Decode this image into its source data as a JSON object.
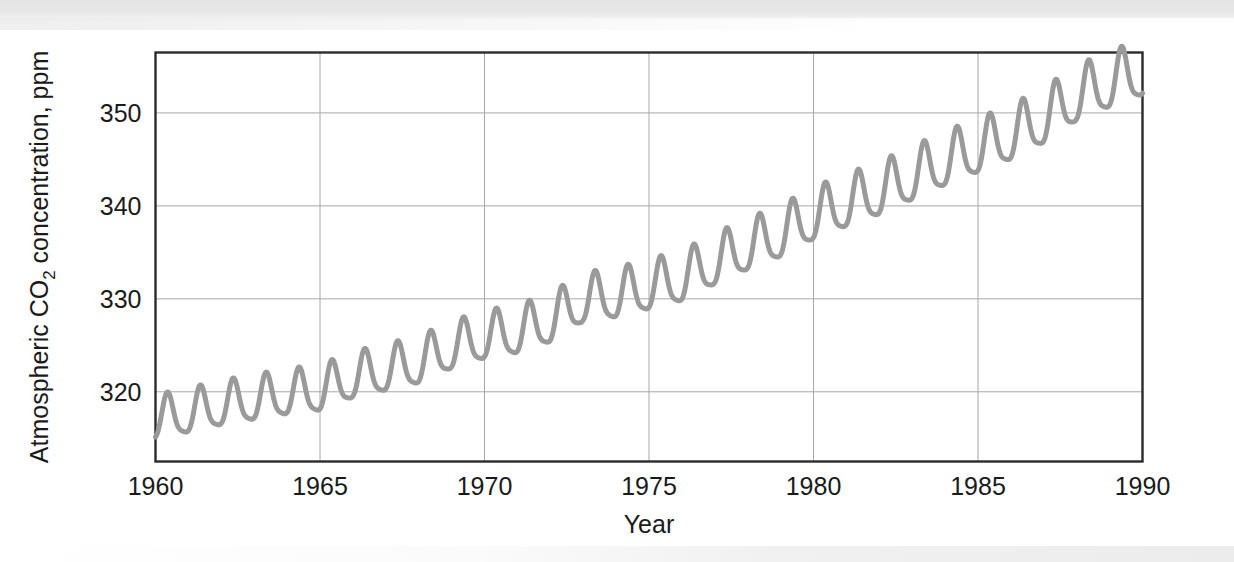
{
  "figure": {
    "background_color": "#ffffff",
    "plot_frame_color": "#2b2b2b",
    "gridline_color": "#a8a8a8",
    "series_color": "#9a9a9a",
    "text_color": "#1a1a1a"
  },
  "chart_data": {
    "type": "line",
    "title": "",
    "subtitle": "",
    "xlabel": "Year",
    "ylabel_parts": {
      "lead": "Atmospheric CO",
      "subscript": "2",
      "trail": " concentration, ppm"
    },
    "ylabel": "Atmospheric CO2  concentration, ppm",
    "xlim": [
      1960,
      1990
    ],
    "ylim": [
      312.5,
      356.5
    ],
    "xticks": [
      1960,
      1965,
      1970,
      1975,
      1980,
      1985,
      1990
    ],
    "xtick_labels": [
      "1960",
      "1965",
      "1970",
      "1975",
      "1980",
      "1985",
      "1990"
    ],
    "yticks": [
      320,
      330,
      340,
      350
    ],
    "ytick_labels": [
      "320",
      "330",
      "340",
      "350"
    ],
    "grid": true,
    "grid_axes": "both",
    "legend": false,
    "legend_position": "none",
    "series": [
      {
        "name": "Atmospheric CO2 concentration (Mauna Loa)",
        "color": "#9a9a9a",
        "line_width": 5,
        "description": "Monthly mean CO2 with rising trend plus seasonal oscillation of about 3 ppm amplitude",
        "annual_means": [
          {
            "year": 1960,
            "value": 316.9
          },
          {
            "year": 1961,
            "value": 317.6
          },
          {
            "year": 1962,
            "value": 318.4
          },
          {
            "year": 1963,
            "value": 319.0
          },
          {
            "year": 1964,
            "value": 319.6
          },
          {
            "year": 1965,
            "value": 320.0
          },
          {
            "year": 1966,
            "value": 321.4
          },
          {
            "year": 1967,
            "value": 322.2
          },
          {
            "year": 1968,
            "value": 323.0
          },
          {
            "year": 1969,
            "value": 324.6
          },
          {
            "year": 1970,
            "value": 325.7
          },
          {
            "year": 1971,
            "value": 326.3
          },
          {
            "year": 1972,
            "value": 327.5
          },
          {
            "year": 1973,
            "value": 329.7
          },
          {
            "year": 1974,
            "value": 330.2
          },
          {
            "year": 1975,
            "value": 331.1
          },
          {
            "year": 1976,
            "value": 332.0
          },
          {
            "year": 1977,
            "value": 333.8
          },
          {
            "year": 1978,
            "value": 335.4
          },
          {
            "year": 1979,
            "value": 336.8
          },
          {
            "year": 1980,
            "value": 338.7
          },
          {
            "year": 1981,
            "value": 340.1
          },
          {
            "year": 1982,
            "value": 341.4
          },
          {
            "year": 1983,
            "value": 343.0
          },
          {
            "year": 1984,
            "value": 344.6
          },
          {
            "year": 1985,
            "value": 346.0
          },
          {
            "year": 1986,
            "value": 347.4
          },
          {
            "year": 1987,
            "value": 349.2
          },
          {
            "year": 1988,
            "value": 351.6
          },
          {
            "year": 1989,
            "value": 353.1
          },
          {
            "year": 1990,
            "value": 354.4
          }
        ],
        "seasonal_amplitude_ppm": {
          "start": 2.8,
          "end": 3.6
        },
        "seasonal_peak_month": 5,
        "endpoints": {
          "start": {
            "year": 1960,
            "value": 317.5
          },
          "end": {
            "year": 1990,
            "value": 352.6
          }
        },
        "observed_min": 314.4,
        "observed_max": 355.3
      }
    ]
  }
}
